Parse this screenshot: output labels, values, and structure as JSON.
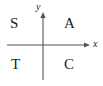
{
  "figure": {
    "name": "quadrant-sign-diagram",
    "background_color": "#ffffff",
    "stroke_color": "#555555",
    "text_color": "#222222",
    "width": 103,
    "height": 86
  },
  "axes": {
    "x_axis": {
      "label": "x",
      "label_style": "italic",
      "from_x": 7,
      "to_x": 88,
      "y": 45,
      "arrow_at": "end"
    },
    "y_axis": {
      "label": "y",
      "label_style": "italic",
      "x": 43,
      "from_y": 80,
      "to_y": 13,
      "arrow_at": "end"
    },
    "origin": {
      "x": 43,
      "y": 45
    }
  },
  "quadrants": [
    {
      "name": "quadrant-2",
      "label": "S",
      "position": "top-left"
    },
    {
      "name": "quadrant-1",
      "label": "A",
      "position": "top-right"
    },
    {
      "name": "quadrant-3",
      "label": "T",
      "position": "bottom-left"
    },
    {
      "name": "quadrant-4",
      "label": "C",
      "position": "bottom-right"
    }
  ]
}
